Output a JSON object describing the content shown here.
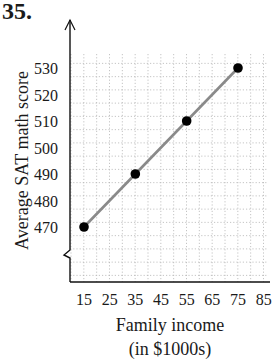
{
  "problem": {
    "number": "35."
  },
  "chart_data": {
    "type": "line",
    "title": "",
    "xlabel": "Family income",
    "xlabel_line2": "(in $1000s)",
    "ylabel": "Average SAT math score",
    "x_ticks": [
      15,
      25,
      35,
      45,
      55,
      65,
      75,
      85
    ],
    "y_ticks": [
      470,
      480,
      490,
      500,
      510,
      520,
      530
    ],
    "xlim": [
      10,
      88
    ],
    "ylim": [
      450,
      540
    ],
    "grid": true,
    "y_axis_break": true,
    "series": [
      {
        "name": "SAT score",
        "x": [
          15,
          35,
          55,
          75
        ],
        "y": [
          470,
          490,
          510,
          530
        ],
        "marker": "filled-circle",
        "line_color": "#8a8a8a",
        "marker_color": "#000000"
      }
    ]
  }
}
